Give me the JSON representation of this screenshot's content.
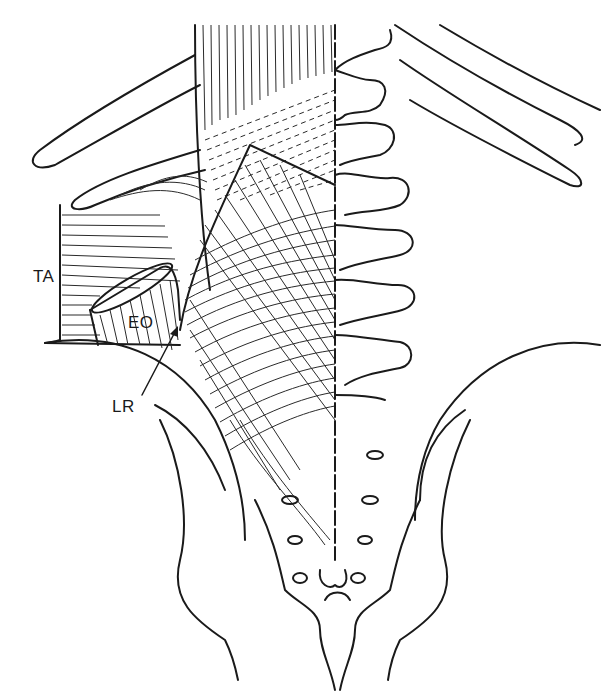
{
  "figure": {
    "labels": {
      "ta": "TA",
      "eo": "EO",
      "lr": "LR"
    },
    "colors": {
      "line": "#1a1a1a",
      "background": "#ffffff"
    }
  }
}
